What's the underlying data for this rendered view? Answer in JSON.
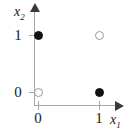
{
  "figure": {
    "axes": {
      "x": {
        "title": "x",
        "subscript": "1",
        "tick_labels": [
          "0",
          "1"
        ],
        "arrow": "right-arrowhead"
      },
      "y": {
        "title": "x",
        "subscript": "2",
        "tick_labels": [
          "0",
          "1"
        ],
        "arrow": "up-arrowhead"
      }
    },
    "colors": {
      "axis": "#a8a8a8",
      "arrow": "#3a3a3a",
      "filled_marker": "#111111",
      "open_marker_border": "#9a9a9a",
      "text": "#1a1a1a",
      "background": "#ffffff"
    }
  },
  "chart_data": {
    "type": "scatter",
    "title": "",
    "xlabel": "x1",
    "ylabel": "x2",
    "xlim": [
      0,
      1
    ],
    "ylim": [
      0,
      1
    ],
    "xticks": [
      0,
      1
    ],
    "yticks": [
      0,
      1
    ],
    "xtick_labels": [
      "0",
      "1"
    ],
    "ytick_labels": [
      "0",
      "1"
    ],
    "grid": false,
    "legend": false,
    "series": [
      {
        "name": "filled",
        "marker": "filled-circle",
        "color": "#111111",
        "points": [
          {
            "x": 0,
            "y": 1,
            "label": "(0, 1)"
          },
          {
            "x": 1,
            "y": 0,
            "label": "(1, 0)"
          }
        ]
      },
      {
        "name": "open",
        "marker": "open-circle",
        "color": "#ffffff",
        "points": [
          {
            "x": 0,
            "y": 0,
            "label": "(0, 0)"
          },
          {
            "x": 1,
            "y": 1,
            "label": "(1, 1)"
          }
        ]
      }
    ]
  }
}
